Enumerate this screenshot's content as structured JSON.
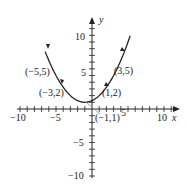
{
  "chart_data": {
    "type": "line",
    "title": "",
    "xlabel": "x",
    "ylabel": "y",
    "xlim": [
      -10,
      10
    ],
    "ylim": [
      -10,
      10
    ],
    "grid": false,
    "x_ticks": [
      -10,
      -5,
      5,
      10
    ],
    "y_ticks": [
      -10,
      -5,
      5,
      10
    ],
    "x_tick_labels": [
      "−10",
      "−5",
      "5",
      "10"
    ],
    "y_tick_labels": [
      "−10",
      "−5",
      "5",
      "10"
    ],
    "series": [
      {
        "name": "parabola",
        "equation": "y = (x+1)^2/4 + 1",
        "x": [
          -6.3,
          -5,
          -3,
          -1,
          1,
          3,
          5.3
        ],
        "y": [
          14.3,
          5,
          2,
          1,
          2,
          5,
          10.9
        ]
      }
    ],
    "annotations": [
      {
        "text": "(−5,5)",
        "x": -5,
        "y": 5
      },
      {
        "text": "(−3,2)",
        "x": -3,
        "y": 2
      },
      {
        "text": "(1,2)",
        "x": 1,
        "y": 2
      },
      {
        "text": "(3,5)",
        "x": 3,
        "y": 5
      },
      {
        "text": "(−1,1)",
        "x": -1,
        "y": 1
      }
    ]
  },
  "labels": {
    "x_axis": "x",
    "y_axis": "y",
    "xt_m10": "−10",
    "xt_m5": "−5",
    "xt_5": "5",
    "xt_10": "10",
    "yt_10": "10",
    "yt_5": "5",
    "yt_m5": "−5",
    "yt_m10": "−10",
    "pt_m5_5": "(−5,5)",
    "pt_m3_2": "(−3,2)",
    "pt_1_2": "(1,2)",
    "pt_3_5": "(3,5)",
    "pt_m1_1": "(−1,1)"
  },
  "colors": {
    "ink": "#222222",
    "leader": "#888888"
  }
}
